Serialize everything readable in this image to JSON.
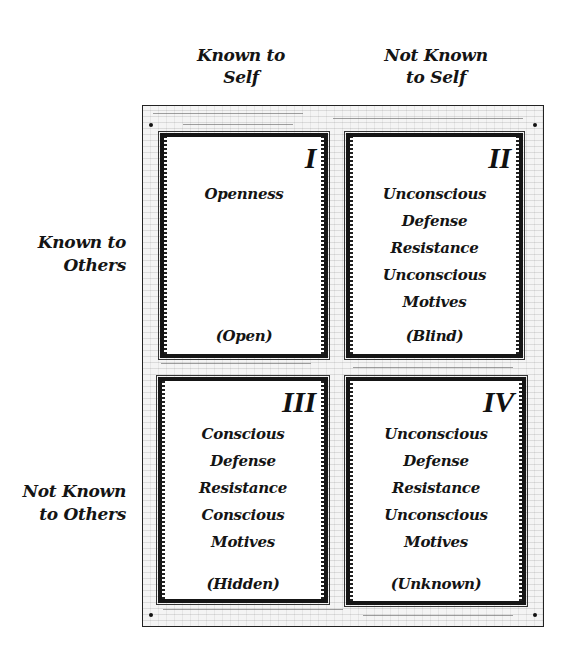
{
  "diagram": {
    "type": "johari-window",
    "columns": [
      {
        "label_line1": "Known to",
        "label_line2": "Self"
      },
      {
        "label_line1": "Not Known",
        "label_line2": "to Self"
      }
    ],
    "rows": [
      {
        "label_line1": "Known to",
        "label_line2": "Others"
      },
      {
        "label_line1": "Not Known",
        "label_line2": "to Others"
      }
    ],
    "panes": [
      {
        "numeral": "I",
        "lines": [
          "Openness"
        ],
        "tag": "(Open)"
      },
      {
        "numeral": "II",
        "lines": [
          "Unconscious",
          "Defense",
          "Resistance",
          "Unconscious",
          "Motives"
        ],
        "tag": "(Blind)"
      },
      {
        "numeral": "III",
        "lines": [
          "Conscious",
          "Defense",
          "Resistance",
          "Conscious",
          "Motives"
        ],
        "tag": "(Hidden)"
      },
      {
        "numeral": "IV",
        "lines": [
          "Unconscious",
          "Defense",
          "Resistance",
          "Unconscious",
          "Motives"
        ],
        "tag": "(Unknown)"
      }
    ]
  }
}
